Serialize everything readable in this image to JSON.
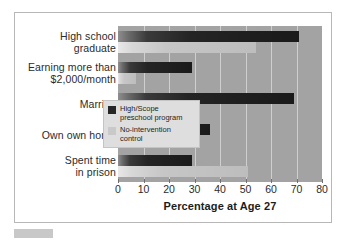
{
  "chart_data": {
    "type": "bar",
    "orientation": "horizontal",
    "title": "",
    "xlabel": "Percentage at Age 27",
    "ylabel": "",
    "xlim": [
      0,
      80
    ],
    "xticks": [
      0,
      10,
      20,
      30,
      40,
      50,
      60,
      70,
      80
    ],
    "grid": true,
    "legend_position": "center-right",
    "categories": [
      "High school\ngraduate",
      "Earning more than\n$2,000/month",
      "Married",
      "Own own home",
      "Spent time\nin prison"
    ],
    "series": [
      {
        "name": "High/Scope\npreschool program",
        "color": "#262626",
        "values": [
          71,
          29,
          69,
          36,
          29
        ]
      },
      {
        "name": "No-intervention control",
        "color": "#c9c9c9",
        "values": [
          54,
          7,
          0,
          14,
          51
        ]
      }
    ]
  },
  "axis": {
    "x_title": "Percentage at Age 27",
    "tick_labels": [
      "0",
      "10",
      "20",
      "30",
      "40",
      "50",
      "60",
      "70",
      "80"
    ]
  },
  "categories": [
    {
      "line1": "High school",
      "line2": "graduate"
    },
    {
      "line1": "Earning more than",
      "line2": "$2,000/month"
    },
    {
      "line1": "Married",
      "line2": ""
    },
    {
      "line1": "Own own home",
      "line2": ""
    },
    {
      "line1": "Spent time",
      "line2": "in prison"
    }
  ],
  "legend": {
    "items": [
      {
        "label": "High/Scope\npreschool program",
        "swatch": "dark-swatch-icon"
      },
      {
        "label": "No-intervention control",
        "swatch": "light-swatch-icon"
      }
    ]
  },
  "colors": {
    "panel": "#a3a3a3",
    "grid": "#cfcfcf",
    "bar_dark": "#262626",
    "bar_light": "#c9c9c9",
    "frame": "#b7b7b7",
    "legend_bg": "#dedede"
  }
}
